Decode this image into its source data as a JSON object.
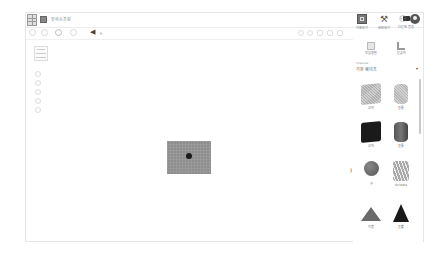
{
  "app": {
    "title": "유하스프링"
  },
  "toolbar": {
    "undo_icon": "◀",
    "redo_icon": "▸"
  },
  "right_tabs": [
    {
      "label": "가져오기",
      "icon": "grid-icon"
    },
    {
      "label": "내보내기",
      "icon": "hammer-icon"
    },
    {
      "label": "다른의 전송",
      "icon": "briefcase-icon"
    }
  ],
  "user": {
    "people_icon": "⚇"
  },
  "panel": {
    "workplane_label": "작업 평면",
    "ruler_label": "눈금자",
    "library_small": "Tinkercad",
    "library_value": "기본 쉐이프",
    "caret": "▾",
    "shapes": [
      {
        "label": "상자",
        "kind": "box-hole"
      },
      {
        "label": "원통",
        "kind": "cyl-hole"
      },
      {
        "label": "상자",
        "kind": "box-solid"
      },
      {
        "label": "원통",
        "kind": "cyl-solid"
      },
      {
        "label": "구",
        "kind": "sphere"
      },
      {
        "label": "Scribble",
        "kind": "scribble"
      },
      {
        "label": "지붕",
        "kind": "roof"
      },
      {
        "label": "원뿔",
        "kind": "cone"
      }
    ]
  },
  "canvas": {
    "collapse_icon": ")"
  }
}
